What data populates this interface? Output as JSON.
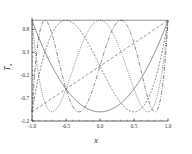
{
  "figure": {
    "background": "#ffffff",
    "axes_color": "#3a3a3a",
    "ylabel": "T",
    "ylabel_sub": "n",
    "xlabel": "x"
  },
  "chart_data": {
    "type": "line",
    "title": "",
    "xlabel": "x",
    "ylabel": "T_n",
    "xlim": [
      -1.0,
      1.0
    ],
    "ylim": [
      -1.2,
      1.05
    ],
    "grid": false,
    "legend": "none",
    "xticks": [
      "-1.0",
      "-0.5",
      "0.0",
      "0.5",
      "1.0"
    ],
    "xtick_values": [
      -1.0,
      -0.5,
      0.0,
      0.5,
      1.0
    ],
    "yticks": [
      "0.8",
      "0.3",
      "-0.2",
      "-0.7",
      "-1.2"
    ],
    "ytick_values": [
      0.8,
      0.3,
      -0.2,
      -0.7,
      -1.2
    ],
    "series": [
      {
        "name": "T_0",
        "degree": 0,
        "dash": "none",
        "color": "#4d4d4d",
        "width": 0.7
      },
      {
        "name": "T_1",
        "degree": 1,
        "dash": "3,2",
        "color": "#4d4d4d",
        "width": 0.7
      },
      {
        "name": "T_2",
        "degree": 2,
        "dash": "none",
        "color": "#4d4d4d",
        "width": 0.7
      },
      {
        "name": "T_3",
        "degree": 3,
        "dash": "2,1.5",
        "color": "#4d4d4d",
        "width": 0.7
      },
      {
        "name": "T_4",
        "degree": 4,
        "dash": "1,1.2",
        "color": "#4d4d4d",
        "width": 0.7
      },
      {
        "name": "T_5",
        "degree": 5,
        "dash": "4,1.5,1,1.5",
        "color": "#4d4d4d",
        "width": 0.7
      }
    ]
  },
  "plot_box": {
    "left": 32,
    "right": 168,
    "top": 18,
    "bottom": 121
  }
}
